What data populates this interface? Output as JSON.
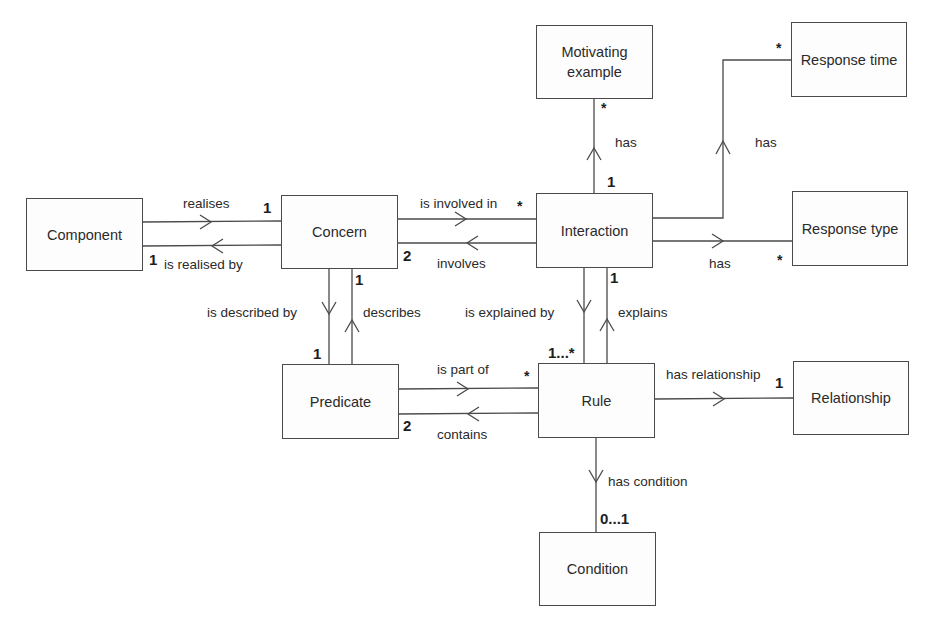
{
  "diagram": {
    "type": "uml-class-diagram",
    "colors": {
      "line": "#4a4a4a",
      "text": "#2a2a2a",
      "background": "#ffffff"
    },
    "boxes": {
      "component": {
        "label": "Component"
      },
      "concern": {
        "label": "Concern"
      },
      "interaction": {
        "label": "Interaction"
      },
      "motivating_example": {
        "label": "Motivating example"
      },
      "response_time": {
        "label": "Response time"
      },
      "response_type": {
        "label": "Response type"
      },
      "predicate": {
        "label": "Predicate"
      },
      "rule": {
        "label": "Rule"
      },
      "relationship": {
        "label": "Relationship"
      },
      "condition": {
        "label": "Condition"
      }
    },
    "associations": {
      "realises": {
        "label": "realises",
        "from": "Component",
        "to": "Concern",
        "multiplicity": "1"
      },
      "is_realised_by": {
        "label": "is realised by",
        "from": "Concern",
        "to": "Component",
        "multiplicity": "1"
      },
      "is_involved_in": {
        "label": "is involved in",
        "from": "Concern",
        "to": "Interaction",
        "multiplicity": "*"
      },
      "involves": {
        "label": "involves",
        "from": "Interaction",
        "to": "Concern",
        "multiplicity": "2"
      },
      "has_motivating_example": {
        "label": "has",
        "from": "Interaction",
        "to": "Motivating example",
        "source_multiplicity": "1",
        "multiplicity": "*"
      },
      "has_response_time": {
        "label": "has",
        "from": "Interaction",
        "to": "Response time",
        "multiplicity": "*"
      },
      "has_response_type": {
        "label": "has",
        "from": "Interaction",
        "to": "Response type",
        "multiplicity": "*"
      },
      "is_described_by": {
        "label": "is described by",
        "from": "Concern",
        "to": "Predicate",
        "multiplicity": "1"
      },
      "describes": {
        "label": "describes",
        "from": "Predicate",
        "to": "Concern",
        "multiplicity": "1"
      },
      "is_explained_by": {
        "label": "is explained by",
        "from": "Interaction",
        "to": "Rule",
        "multiplicity": "1...*"
      },
      "explains": {
        "label": "explains",
        "from": "Rule",
        "to": "Interaction",
        "multiplicity": "1"
      },
      "is_part_of": {
        "label": "is part of",
        "from": "Predicate",
        "to": "Rule",
        "multiplicity": "*"
      },
      "contains": {
        "label": "contains",
        "from": "Rule",
        "to": "Predicate",
        "multiplicity": "2"
      },
      "has_relationship": {
        "label": "has relationship",
        "from": "Rule",
        "to": "Relationship",
        "multiplicity": "1"
      },
      "has_condition": {
        "label": "has condition",
        "from": "Rule",
        "to": "Condition",
        "multiplicity": "0...1"
      }
    }
  }
}
